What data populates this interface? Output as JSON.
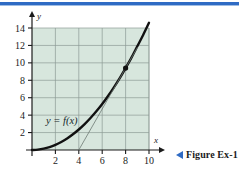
{
  "page": {
    "background_color": "#ffffff",
    "rule_color": "#2f6bc4"
  },
  "caption": {
    "marker_icon": "left-triangle-icon",
    "text": "Figure Ex-1"
  },
  "chart_data": {
    "type": "line",
    "title": "",
    "subtitle": "",
    "xlabel": "x",
    "ylabel": "y",
    "xlim": [
      0,
      10.6
    ],
    "ylim": [
      0,
      14.6
    ],
    "xticks": [
      2,
      4,
      6,
      8,
      10
    ],
    "yticks": [
      2,
      4,
      6,
      8,
      10,
      12,
      14
    ],
    "xtick_labels": [
      "2",
      "4",
      "6",
      "8",
      "10"
    ],
    "ytick_labels": [
      "2",
      "4",
      "6",
      "8",
      "10",
      "12",
      "14"
    ],
    "grid": true,
    "grid_color": "#8d9b95",
    "plot_bg_color": "#d7e6dd",
    "legend": "none",
    "annotations": [
      {
        "name": "curve-label",
        "text": "y = f(x)",
        "x": 2.55,
        "y": 3.0
      }
    ],
    "series": [
      {
        "name": "f(x)",
        "type": "curve",
        "color": "#111111",
        "width": 2.4,
        "x": [
          0,
          0.5,
          1,
          1.5,
          2,
          2.5,
          3,
          3.5,
          4,
          4.5,
          5,
          5.5,
          6,
          6.5,
          7,
          7.5,
          8,
          8.5,
          9,
          9.5,
          10
        ],
        "values": [
          0.0,
          0.04,
          0.15,
          0.33,
          0.59,
          0.92,
          1.32,
          1.8,
          2.35,
          2.97,
          3.67,
          4.44,
          5.28,
          6.2,
          7.19,
          8.25,
          9.4,
          10.6,
          11.9,
          13.2,
          14.6
        ]
      },
      {
        "name": "secant-line",
        "type": "line",
        "color": "#6d7a74",
        "width": 0.8,
        "x": [
          4.0,
          9.0
        ],
        "values": [
          0.0,
          11.75
        ]
      }
    ],
    "points": [
      {
        "name": "tangency-point",
        "x": 8,
        "y": 9.4,
        "color": "#111111",
        "radius": 2.6
      }
    ]
  }
}
